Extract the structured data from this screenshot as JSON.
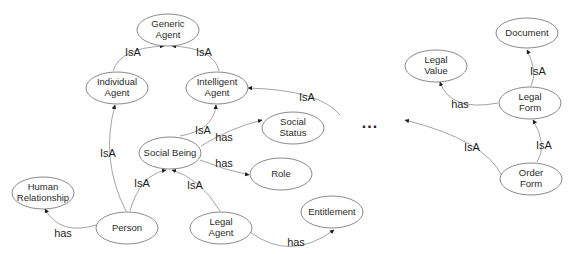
{
  "diagram": {
    "type": "ontology-graph",
    "nodes": {
      "generic_agent": {
        "line1": "Generic",
        "line2": "Agent"
      },
      "individual_agent": {
        "line1": "Individual",
        "line2": "Agent"
      },
      "intelligent_agent": {
        "line1": "Intelligent",
        "line2": "Agent"
      },
      "social_status": {
        "line1": "Social",
        "line2": "Status"
      },
      "social_being": {
        "line1": "Social Being"
      },
      "role": {
        "line1": "Role"
      },
      "human_relationship": {
        "line1": "Human",
        "line2": "Relationship"
      },
      "person": {
        "line1": "Person"
      },
      "legal_agent": {
        "line1": "Legal",
        "line2": "Agent"
      },
      "entitlement": {
        "line1": "Entitlement"
      },
      "document": {
        "line1": "Document"
      },
      "legal_value": {
        "line1": "Legal",
        "line2": "Value"
      },
      "legal_form": {
        "line1": "Legal",
        "line2": "Form"
      },
      "order_form": {
        "line1": "Order",
        "line2": "Form"
      }
    },
    "ellipsis": "...",
    "edges": [
      {
        "id": "individual_isa_generic",
        "from": "Individual Agent",
        "to": "Generic Agent",
        "label": "IsA"
      },
      {
        "id": "intelligent_isa_generic",
        "from": "Intelligent Agent",
        "to": "Generic Agent",
        "label": "IsA"
      },
      {
        "id": "person_isa_individual",
        "from": "Person",
        "to": "Individual Agent",
        "label": "IsA"
      },
      {
        "id": "social_isa_intelligent",
        "from": "Social Being",
        "to": "Intelligent Agent",
        "label": "IsA"
      },
      {
        "id": "ellipsis_isa_intelligent",
        "from": "...",
        "to": "Intelligent Agent",
        "label": "IsA"
      },
      {
        "id": "social_has_status",
        "from": "Social Being",
        "to": "Social Status",
        "label": "has"
      },
      {
        "id": "social_has_role",
        "from": "Social Being",
        "to": "Role",
        "label": "has"
      },
      {
        "id": "person_isa_social",
        "from": "Person",
        "to": "Social Being",
        "label": "IsA"
      },
      {
        "id": "legal_isa_social",
        "from": "Legal Agent",
        "to": "Social Being",
        "label": "IsA"
      },
      {
        "id": "person_has_relationship",
        "from": "Person",
        "to": "Human Relationship",
        "label": "has"
      },
      {
        "id": "legal_has_entitlement",
        "from": "Legal Agent",
        "to": "Entitlement",
        "label": "has"
      },
      {
        "id": "legalform_isa_document",
        "from": "Legal Form",
        "to": "Document",
        "label": "IsA"
      },
      {
        "id": "legalform_has_value",
        "from": "Legal Form",
        "to": "Legal Value",
        "label": "has"
      },
      {
        "id": "order_isa_legalform",
        "from": "Order Form",
        "to": "Legal Form",
        "label": "IsA"
      },
      {
        "id": "order_isa_ellipsis",
        "from": "Order Form",
        "to": "...",
        "label": "IsA"
      }
    ]
  }
}
